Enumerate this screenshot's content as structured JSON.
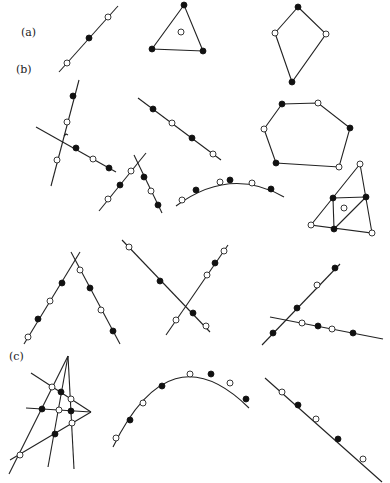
{
  "labels": {
    "a": "(a)",
    "b": "(b)",
    "c": "(c)"
  },
  "label_positions": {
    "a": [
      21,
      26
    ],
    "b": [
      16,
      63
    ],
    "c": [
      9,
      350
    ]
  },
  "colors": {
    "ink": "#222222",
    "filled_point": "#111111",
    "open_point": "#ffffff",
    "background": "#ffffff"
  },
  "point_radius": 3,
  "figures": [
    {
      "id": "a-line",
      "group": "a",
      "lines": [
        [
          59,
          72,
          118,
          6
        ]
      ],
      "points": [
        [
          67,
          63,
          "open"
        ],
        [
          89,
          38,
          "filled"
        ],
        [
          108,
          17,
          "open"
        ]
      ]
    },
    {
      "id": "a-triangle",
      "group": "a",
      "polygons": [
        [
          [
            184,
            5
          ],
          [
            152,
            49
          ],
          [
            203,
            51
          ]
        ]
      ],
      "points": [
        [
          184,
          5,
          "filled"
        ],
        [
          152,
          49,
          "filled"
        ],
        [
          203,
          51,
          "filled"
        ],
        [
          181,
          32,
          "open"
        ]
      ]
    },
    {
      "id": "a-kite",
      "group": "a",
      "polygons": [
        [
          [
            298,
            7
          ],
          [
            326,
            34
          ],
          [
            292,
            82
          ],
          [
            275,
            33
          ]
        ]
      ],
      "points": [
        [
          298,
          7,
          "filled"
        ],
        [
          275,
          33,
          "open"
        ],
        [
          326,
          34,
          "open"
        ],
        [
          292,
          82,
          "filled"
        ]
      ]
    },
    {
      "id": "b-crossing-pair",
      "group": "b",
      "lines": [
        [
          51,
          186,
          79,
          80
        ],
        [
          36,
          127,
          116,
          172
        ]
      ],
      "points": [
        [
          73,
          96,
          "filled"
        ],
        [
          67,
          122,
          "open"
        ],
        [
          57,
          160,
          "open"
        ],
        [
          76,
          148,
          "filled"
        ],
        [
          93,
          159,
          "open"
        ],
        [
          109,
          168,
          "filled"
        ]
      ],
      "marks": [
        [
          66,
          135
        ]
      ]
    },
    {
      "id": "b-diagonal",
      "group": "b",
      "lines": [
        [
          138,
          98,
          221,
          160
        ]
      ],
      "points": [
        [
          153,
          109,
          "filled"
        ],
        [
          172,
          123,
          "open"
        ],
        [
          192,
          138,
          "filled"
        ],
        [
          213,
          154,
          "open"
        ]
      ]
    },
    {
      "id": "b-x-pair",
      "group": "b",
      "lines": [
        [
          99,
          211,
          146,
          153
        ],
        [
          134,
          155,
          162,
          213
        ]
      ],
      "points": [
        [
          108,
          199,
          "open"
        ],
        [
          120,
          185,
          "filled"
        ],
        [
          131,
          171,
          "open"
        ],
        [
          144,
          177,
          "filled"
        ],
        [
          151,
          191,
          "open"
        ],
        [
          158,
          205,
          "filled"
        ]
      ]
    },
    {
      "id": "b-arc",
      "group": "b",
      "paths": [
        "M176,206 Q230,166 284,197"
      ],
      "points": [
        [
          182,
          200,
          "open"
        ],
        [
          196,
          190,
          "filled"
        ],
        [
          220,
          182,
          "open"
        ],
        [
          230,
          180,
          "filled"
        ],
        [
          252,
          183,
          "open"
        ],
        [
          271,
          189,
          "filled"
        ]
      ]
    },
    {
      "id": "b-hexagon",
      "group": "b",
      "polygons": [
        [
          [
            282,
            104
          ],
          [
            318,
            103
          ],
          [
            350,
            128
          ],
          [
            339,
            167
          ],
          [
            276,
            163
          ],
          [
            264,
            129
          ]
        ]
      ],
      "points": [
        [
          282,
          104,
          "filled"
        ],
        [
          318,
          103,
          "open"
        ],
        [
          350,
          128,
          "filled"
        ],
        [
          339,
          167,
          "open"
        ],
        [
          276,
          163,
          "filled"
        ],
        [
          264,
          129,
          "open"
        ]
      ]
    },
    {
      "id": "b-subdivided-triangle",
      "group": "b",
      "polygons": [
        [
          [
            360,
            164
          ],
          [
            311,
            225
          ],
          [
            372,
            233
          ]
        ]
      ],
      "lines": [
        [
          333,
          198,
          366,
          197
        ],
        [
          333,
          198,
          334,
          229
        ],
        [
          366,
          197,
          334,
          229
        ]
      ],
      "points": [
        [
          360,
          164,
          "open"
        ],
        [
          311,
          225,
          "open"
        ],
        [
          372,
          233,
          "open"
        ],
        [
          333,
          198,
          "filled"
        ],
        [
          366,
          197,
          "filled"
        ],
        [
          334,
          229,
          "filled"
        ],
        [
          344,
          208,
          "open"
        ]
      ]
    },
    {
      "id": "row3-lambda",
      "group": "unlabeled",
      "lines": [
        [
          24,
          344,
          80,
          252
        ],
        [
          71,
          252,
          120,
          344
        ]
      ],
      "points": [
        [
          28,
          337,
          "open"
        ],
        [
          38,
          319,
          "filled"
        ],
        [
          50,
          301,
          "open"
        ],
        [
          62,
          283,
          "filled"
        ],
        [
          80,
          270,
          "open"
        ],
        [
          90,
          288,
          "filled"
        ],
        [
          101,
          310,
          "open"
        ],
        [
          113,
          331,
          "filled"
        ]
      ]
    },
    {
      "id": "row3-x",
      "group": "unlabeled",
      "lines": [
        [
          122,
          240,
          210,
          332
        ],
        [
          166,
          335,
          228,
          245
        ]
      ],
      "points": [
        [
          129,
          247,
          "open"
        ],
        [
          160,
          281,
          "filled"
        ],
        [
          193,
          313,
          "filled"
        ],
        [
          206,
          326,
          "open"
        ],
        [
          176,
          320,
          "open"
        ],
        [
          207,
          275,
          "open"
        ],
        [
          215,
          263,
          "filled"
        ],
        [
          224,
          251,
          "open"
        ]
      ]
    },
    {
      "id": "row3-crossing",
      "group": "unlabeled",
      "lines": [
        [
          262,
          345,
          340,
          264
        ],
        [
          270,
          317,
          383,
          339
        ]
      ],
      "points": [
        [
          273,
          333,
          "filled"
        ],
        [
          297,
          308,
          "filled"
        ],
        [
          317,
          285,
          "open"
        ],
        [
          335,
          268,
          "filled"
        ],
        [
          302,
          323,
          "open"
        ],
        [
          318,
          326,
          "filled"
        ],
        [
          332,
          329,
          "open"
        ],
        [
          353,
          333,
          "filled"
        ]
      ]
    },
    {
      "id": "c-complete-quadrilateral",
      "group": "c",
      "lines": [
        [
          68,
          356,
          9,
          474
        ],
        [
          68,
          356,
          48,
          467
        ],
        [
          68,
          356,
          74,
          469
        ],
        [
          31,
          373,
          91,
          412
        ],
        [
          26,
          408,
          91,
          412
        ],
        [
          91,
          412,
          10,
          460
        ]
      ],
      "points": [
        [
          52,
          387,
          "open"
        ],
        [
          61,
          392,
          "filled"
        ],
        [
          71,
          399,
          "open"
        ],
        [
          42,
          409,
          "filled"
        ],
        [
          59,
          410,
          "open"
        ],
        [
          71,
          411,
          "filled"
        ],
        [
          72,
          423,
          "open"
        ],
        [
          55,
          434,
          "filled"
        ],
        [
          20,
          455,
          "open"
        ]
      ]
    },
    {
      "id": "c-arc",
      "group": "c",
      "paths": [
        "M113,447 Q170,330 249,408"
      ],
      "points": [
        [
          116,
          438,
          "open"
        ],
        [
          130,
          420,
          "filled"
        ],
        [
          143,
          403,
          "open"
        ],
        [
          162,
          386,
          "filled"
        ],
        [
          190,
          374,
          "open"
        ],
        [
          211,
          374,
          "filled"
        ],
        [
          230,
          383,
          "open"
        ],
        [
          246,
          399,
          "filled"
        ]
      ]
    },
    {
      "id": "c-line",
      "group": "c",
      "lines": [
        [
          265,
          378,
          382,
          482
        ]
      ],
      "points": [
        [
          282,
          392,
          "open"
        ],
        [
          298,
          405,
          "filled"
        ],
        [
          316,
          419,
          "open"
        ],
        [
          338,
          439,
          "filled"
        ],
        [
          363,
          459,
          "open"
        ]
      ]
    }
  ]
}
